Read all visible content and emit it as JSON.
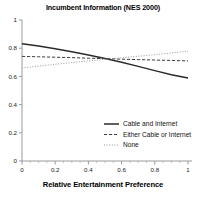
{
  "chart_data": {
    "type": "line",
    "title": "Incumbent Information (NES 2000)",
    "xlabel": "Relative Entertainment Preference",
    "ylabel": "",
    "xlim": [
      0,
      1
    ],
    "ylim": [
      0,
      1
    ],
    "grid": false,
    "legend_position": "center-right",
    "xticks": [
      "0",
      "0.2",
      "0.4",
      "0.6",
      "0.8",
      "1"
    ],
    "xtick_values": [
      0,
      0.2,
      0.4,
      0.6,
      0.8,
      1
    ],
    "yticks": [
      "0",
      "0.2",
      "0.4",
      "0.6",
      "0.8",
      "1"
    ],
    "ytick_values": [
      0,
      0.2,
      0.4,
      0.6,
      0.8,
      1
    ],
    "x": [
      0,
      0.1,
      0.2,
      0.3,
      0.4,
      0.5,
      0.6,
      0.7,
      0.8,
      0.9,
      1
    ],
    "series": [
      {
        "name": "Cable and Internet",
        "style": "solid",
        "color": "#2b2b2b",
        "values": [
          0.832,
          0.815,
          0.796,
          0.775,
          0.752,
          0.727,
          0.7,
          0.671,
          0.641,
          0.612,
          0.588
        ]
      },
      {
        "name": "Either Cable or Internet",
        "style": "dashed",
        "color": "#3d3d3d",
        "values": [
          0.742,
          0.739,
          0.736,
          0.733,
          0.729,
          0.726,
          0.722,
          0.719,
          0.716,
          0.713,
          0.71
        ]
      },
      {
        "name": "None",
        "style": "dotted",
        "color": "#9a9a9a",
        "values": [
          0.66,
          0.673,
          0.686,
          0.698,
          0.71,
          0.721,
          0.732,
          0.743,
          0.754,
          0.766,
          0.779
        ]
      }
    ]
  },
  "axes": {
    "colors": {
      "axis_line": "#9b9b9b",
      "tick_label": "#1a1a1a",
      "background": "#ffffff"
    }
  },
  "legend": {
    "entries": [
      {
        "label": "Cable and Internet",
        "style": "solid"
      },
      {
        "label": "Either Cable or Internet",
        "style": "dashed"
      },
      {
        "label": "None",
        "style": "dotted"
      }
    ]
  }
}
